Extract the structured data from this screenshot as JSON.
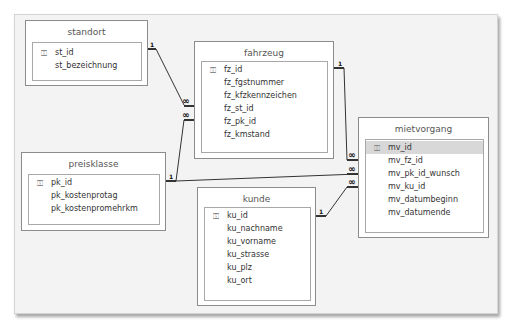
{
  "diagram": {
    "type": "relationships",
    "tables": [
      {
        "name": "standort",
        "fields": [
          {
            "name": "st_id",
            "primary_key": true
          },
          {
            "name": "st_bezeichnung",
            "primary_key": false
          }
        ]
      },
      {
        "name": "fahrzeug",
        "fields": [
          {
            "name": "fz_id",
            "primary_key": true
          },
          {
            "name": "fz_fgstnummer",
            "primary_key": false
          },
          {
            "name": "fz_kfzkennzeichen",
            "primary_key": false
          },
          {
            "name": "fz_st_id",
            "primary_key": false
          },
          {
            "name": "fz_pk_id",
            "primary_key": false
          },
          {
            "name": "fz_kmstand",
            "primary_key": false
          }
        ]
      },
      {
        "name": "mietvorgang",
        "fields": [
          {
            "name": "mv_id",
            "primary_key": true,
            "selected": true
          },
          {
            "name": "mv_fz_id",
            "primary_key": false
          },
          {
            "name": "mv_pk_id_wunsch",
            "primary_key": false
          },
          {
            "name": "mv_ku_id",
            "primary_key": false
          },
          {
            "name": "mv_datumbeginn",
            "primary_key": false
          },
          {
            "name": "mv_datumende",
            "primary_key": false
          }
        ]
      },
      {
        "name": "preisklasse",
        "fields": [
          {
            "name": "pk_id",
            "primary_key": true
          },
          {
            "name": "pk_kostenprotag",
            "primary_key": false
          },
          {
            "name": "pk_kostenpromehrkm",
            "primary_key": false
          }
        ]
      },
      {
        "name": "kunde",
        "fields": [
          {
            "name": "ku_id",
            "primary_key": true
          },
          {
            "name": "ku_nachname",
            "primary_key": false
          },
          {
            "name": "ku_vorname",
            "primary_key": false
          },
          {
            "name": "ku_strasse",
            "primary_key": false
          },
          {
            "name": "ku_plz",
            "primary_key": false
          },
          {
            "name": "ku_ort",
            "primary_key": false
          }
        ]
      }
    ],
    "relationships": [
      {
        "from": "standort.st_id",
        "to": "fahrzeug.fz_st_id",
        "from_label": "1",
        "to_label": "∞"
      },
      {
        "from": "preisklasse.pk_id",
        "to": "fahrzeug.fz_pk_id",
        "from_label": "1",
        "to_label": "∞"
      },
      {
        "from": "fahrzeug.fz_id",
        "to": "mietvorgang.mv_fz_id",
        "from_label": "1",
        "to_label": "∞"
      },
      {
        "from": "preisklasse.pk_id",
        "to": "mietvorgang.mv_pk_id_wunsch",
        "from_label": "1",
        "to_label": "∞"
      },
      {
        "from": "kunde.ku_id",
        "to": "mietvorgang.mv_ku_id",
        "from_label": "1",
        "to_label": "∞"
      }
    ],
    "icons": {
      "primary_key": "key-icon"
    },
    "labels": {
      "one": "1",
      "many": "∞",
      "key_glyph": "⚿"
    }
  }
}
